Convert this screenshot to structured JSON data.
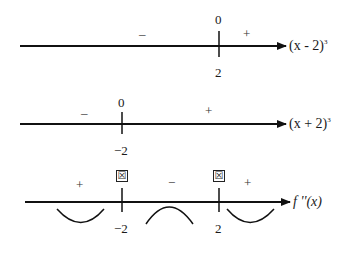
{
  "diagram": {
    "type": "sign-chart",
    "rows": [
      {
        "expression": "(x - 2)³",
        "expression_base": "(x - 2)",
        "expression_exp": "3",
        "critical_point": "2",
        "value_at_point": "0",
        "signs": [
          "–",
          "+"
        ]
      },
      {
        "expression": "(x + 2)³",
        "expression_base": "(x + 2)",
        "expression_exp": "3",
        "critical_point": "−2",
        "value_at_point": "0",
        "signs": [
          "–",
          "+"
        ]
      },
      {
        "expression": "f ''(x)",
        "expression_label": "f ''(x)",
        "critical_points": [
          "−2",
          "2"
        ],
        "point_markers": [
          "☒",
          "☒"
        ],
        "signs": [
          "+",
          "−",
          "+"
        ],
        "concavity": [
          "concave-up",
          "concave-down",
          "concave-up"
        ]
      }
    ]
  }
}
